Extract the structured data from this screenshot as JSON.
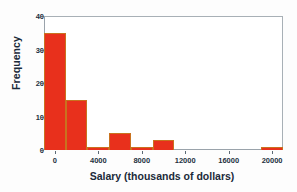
{
  "chart_data": {
    "type": "bar",
    "title": "",
    "xlabel": "Salary (thousands of dollars)",
    "ylabel": "Frequency",
    "xlim": [
      -1000,
      21000
    ],
    "ylim": [
      0,
      40
    ],
    "grid": false,
    "legend": null,
    "bin_width": 2000,
    "bar_color": "#e8301c",
    "bar_edge_color": "#c9721f",
    "xticks": [
      0,
      4000,
      8000,
      12000,
      16000,
      20000
    ],
    "xtick_labels": [
      "0",
      "4000",
      "8000",
      "12000",
      "16000",
      "20000"
    ],
    "yticks": [
      0,
      10,
      20,
      30,
      40
    ],
    "ytick_labels": [
      "0",
      "10",
      "20",
      "30",
      "40"
    ],
    "bins": [
      {
        "x0": -1000,
        "x1": 1000,
        "value": 35
      },
      {
        "x0": 1000,
        "x1": 3000,
        "value": 15
      },
      {
        "x0": 3000,
        "x1": 5000,
        "value": 1
      },
      {
        "x0": 5000,
        "x1": 7000,
        "value": 5
      },
      {
        "x0": 7000,
        "x1": 9000,
        "value": 1
      },
      {
        "x0": 9000,
        "x1": 11000,
        "value": 3
      },
      {
        "x0": 11000,
        "x1": 13000,
        "value": 0
      },
      {
        "x0": 13000,
        "x1": 15000,
        "value": 0
      },
      {
        "x0": 15000,
        "x1": 17000,
        "value": 0
      },
      {
        "x0": 17000,
        "x1": 19000,
        "value": 0
      },
      {
        "x0": 19000,
        "x1": 21000,
        "value": 1
      }
    ],
    "categories": [
      "-1000 to 1000",
      "1000 to 3000",
      "3000 to 5000",
      "5000 to 7000",
      "7000 to 9000",
      "9000 to 11000",
      "11000 to 13000",
      "13000 to 15000",
      "15000 to 17000",
      "17000 to 19000",
      "19000 to 21000"
    ],
    "values": [
      35,
      15,
      1,
      5,
      1,
      3,
      0,
      0,
      0,
      0,
      1
    ]
  }
}
